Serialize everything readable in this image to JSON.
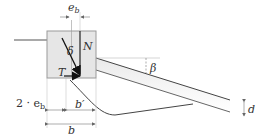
{
  "diagram": {
    "labels": {
      "eccentricity": "e",
      "eccentricity_sub": "b",
      "angle_load": "δ",
      "normal_force": "N",
      "tangential_force": "T",
      "slope_angle": "β",
      "distance": "d",
      "double_ecc_prefix": "2 · e",
      "double_ecc_sub": "b",
      "effective_width": "b′",
      "width": "b"
    },
    "colors": {
      "block_fill": "#e6e6e6",
      "block_stroke": "#9a9a9a",
      "line": "#555555",
      "dim": "#888888",
      "arrow": "#111111"
    }
  }
}
